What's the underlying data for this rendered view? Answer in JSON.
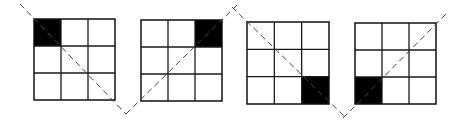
{
  "diagram": {
    "colors": {
      "cell_fill": "#000000",
      "grid_line": "#1a1a1a",
      "dashed_line": "#444444",
      "background": "#ffffff"
    },
    "grids": [
      {
        "id": "grid-1",
        "rows": 3,
        "cols": 3,
        "x": 34,
        "y": 19,
        "size": 81,
        "filled_cell": {
          "row": 0,
          "col": 0,
          "label": "top-left"
        },
        "diagonal": {
          "direction": "top-left to bottom-right",
          "x1": 20,
          "y1": 4,
          "x2": 126,
          "y2": 114
        }
      },
      {
        "id": "grid-2",
        "rows": 3,
        "cols": 3,
        "x": 141,
        "y": 20,
        "size": 81,
        "filled_cell": {
          "row": 0,
          "col": 2,
          "label": "top-right"
        },
        "diagonal": {
          "direction": "bottom-left to top-right",
          "x1": 126,
          "y1": 114,
          "x2": 238,
          "y2": 4
        }
      },
      {
        "id": "grid-3",
        "rows": 3,
        "cols": 3,
        "x": 247,
        "y": 22,
        "size": 82,
        "filled_cell": {
          "row": 2,
          "col": 2,
          "label": "bottom-right"
        },
        "diagonal": {
          "direction": "top-left to bottom-right",
          "x1": 232,
          "y1": 7,
          "x2": 346,
          "y2": 118
        }
      },
      {
        "id": "grid-4",
        "rows": 3,
        "cols": 3,
        "x": 355,
        "y": 23,
        "size": 81,
        "filled_cell": {
          "row": 2,
          "col": 0,
          "label": "bottom-left"
        },
        "diagonal": {
          "direction": "bottom-left to top-right",
          "x1": 343,
          "y1": 118,
          "x2": 448,
          "y2": 12
        }
      }
    ]
  }
}
